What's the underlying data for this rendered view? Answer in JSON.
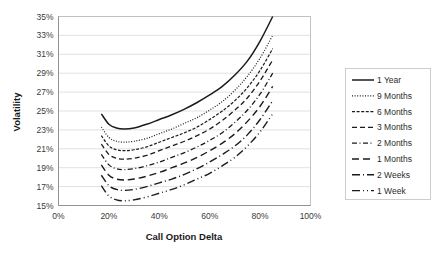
{
  "chart_data": {
    "type": "line",
    "title": "",
    "xlabel": "Call Option Delta",
    "ylabel": "Volatility",
    "xlim": [
      0,
      100
    ],
    "ylim": [
      15,
      35
    ],
    "x_ticks": [
      "0%",
      "20%",
      "40%",
      "60%",
      "80%",
      "100%"
    ],
    "x_tick_values": [
      0,
      20,
      40,
      60,
      80,
      100
    ],
    "y_ticks": [
      "15%",
      "17%",
      "19%",
      "21%",
      "23%",
      "25%",
      "27%",
      "29%",
      "31%",
      "33%",
      "35%"
    ],
    "y_tick_values": [
      15,
      17,
      19,
      21,
      23,
      25,
      27,
      29,
      31,
      33,
      35
    ],
    "grid": "horizontal",
    "legend_position": "right",
    "x_unit": "%",
    "y_unit": "%",
    "x": [
      17,
      20,
      23,
      26,
      30,
      35,
      40,
      45,
      50,
      55,
      60,
      65,
      70,
      75,
      80,
      85
    ],
    "series": [
      {
        "name": "1 Year",
        "dash": "solid",
        "values": [
          24.7,
          23.6,
          23.2,
          23.1,
          23.2,
          23.6,
          24.1,
          24.6,
          25.2,
          25.9,
          26.7,
          27.6,
          28.8,
          30.3,
          32.4,
          35.0
        ]
      },
      {
        "name": "9 Months",
        "dash": "dotted",
        "values": [
          23.3,
          22.2,
          21.8,
          21.7,
          21.8,
          22.1,
          22.6,
          23.1,
          23.7,
          24.3,
          25.1,
          26.0,
          27.2,
          28.7,
          30.6,
          33.0
        ]
      },
      {
        "name": "6 Months",
        "dash": "dash-short",
        "values": [
          22.4,
          21.3,
          20.9,
          20.8,
          20.9,
          21.2,
          21.7,
          22.2,
          22.7,
          23.3,
          24.1,
          25.0,
          26.1,
          27.5,
          29.3,
          31.6
        ]
      },
      {
        "name": "3 Months",
        "dash": "dash-long",
        "values": [
          21.5,
          20.4,
          20.0,
          19.9,
          20.0,
          20.3,
          20.8,
          21.3,
          21.8,
          22.4,
          23.1,
          24.0,
          25.1,
          26.4,
          28.2,
          30.4
        ]
      },
      {
        "name": "2 Months",
        "dash": "dash-dot",
        "values": [
          20.4,
          19.3,
          18.9,
          18.8,
          18.9,
          19.2,
          19.6,
          20.1,
          20.6,
          21.2,
          21.9,
          22.7,
          23.8,
          25.1,
          26.8,
          29.0
        ]
      },
      {
        "name": "1 Months",
        "dash": "dash-gap",
        "values": [
          19.3,
          18.2,
          17.8,
          17.7,
          17.8,
          18.1,
          18.5,
          19.0,
          19.5,
          20.1,
          20.8,
          21.6,
          22.6,
          23.9,
          25.5,
          27.6
        ]
      },
      {
        "name": "2 Weeks",
        "dash": "dash-dot-long",
        "values": [
          18.2,
          17.1,
          16.7,
          16.6,
          16.7,
          17.0,
          17.4,
          17.8,
          18.3,
          18.9,
          19.6,
          20.4,
          21.3,
          22.5,
          24.1,
          26.1
        ]
      },
      {
        "name": "1 Week",
        "dash": "dash-dot-dot",
        "values": [
          17.1,
          16.0,
          15.6,
          15.5,
          15.6,
          15.9,
          16.3,
          16.7,
          17.2,
          17.8,
          18.4,
          19.2,
          20.1,
          21.3,
          22.8,
          24.7
        ]
      }
    ]
  }
}
